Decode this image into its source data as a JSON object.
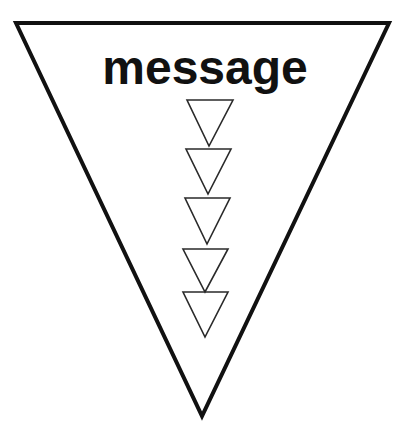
{
  "diagram": {
    "label": "message",
    "colors": {
      "background": "#ffffff",
      "stroke": "#111111",
      "small_stroke": "#2a2a2a",
      "text": "#111111"
    },
    "outer_triangle": {
      "points": [
        [
          16,
          23
        ],
        [
          389,
          23
        ],
        [
          202,
          416
        ]
      ],
      "stroke_width": 4
    },
    "label_position": {
      "x": 205,
      "y": 84
    },
    "inner_triangles": [
      {
        "top_left": [
          187,
          100
        ],
        "top_right": [
          233,
          100
        ],
        "apex": [
          209,
          146
        ]
      },
      {
        "top_left": [
          186,
          149
        ],
        "top_right": [
          231,
          149
        ],
        "apex": [
          208,
          194
        ]
      },
      {
        "top_left": [
          185,
          198
        ],
        "top_right": [
          230,
          198
        ],
        "apex": [
          207,
          244
        ]
      },
      {
        "top_left": [
          183,
          249
        ],
        "top_right": [
          228,
          249
        ],
        "apex": [
          205,
          292
        ]
      },
      {
        "top_left": [
          183,
          292
        ],
        "top_right": [
          228,
          292
        ],
        "apex": [
          205,
          337
        ]
      }
    ]
  }
}
